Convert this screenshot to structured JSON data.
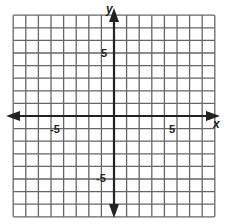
{
  "diagram": {
    "type": "coordinate-plane",
    "x_axis_label": "x",
    "y_axis_label": "y",
    "tick_labels": {
      "x_neg": "-5",
      "x_pos": "5",
      "y_pos": "5",
      "y_neg": "-5"
    },
    "x_range": [
      -8,
      8
    ],
    "y_range": [
      -8,
      8
    ],
    "grid_step": 1,
    "colors": {
      "grid": "#555555",
      "axis": "#222222",
      "background": "#ffffff"
    }
  },
  "chart_data": {
    "type": "scatter",
    "title": "",
    "xlabel": "x",
    "ylabel": "y",
    "xlim": [
      -8,
      8
    ],
    "ylim": [
      -8,
      8
    ],
    "grid": true,
    "x_ticks_labeled": [
      -5,
      5
    ],
    "y_ticks_labeled": [
      -5,
      5
    ],
    "series": []
  }
}
